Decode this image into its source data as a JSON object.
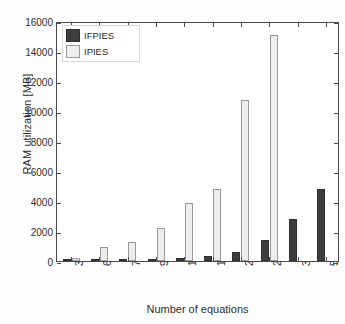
{
  "chart_data": {
    "type": "bar",
    "title": "",
    "xlabel": "Number of equations",
    "ylabel": "RAM utilization [MB]",
    "categories": [
      "3212",
      "6424",
      "7212",
      "9636",
      "12812",
      "14424",
      "21636",
      "25624",
      "38436",
      "51248"
    ],
    "series": [
      {
        "name": "IFPIES",
        "color": "#3d3d3d",
        "values": [
          40,
          90,
          130,
          110,
          170,
          360,
          600,
          1420,
          2800,
          4780
        ]
      },
      {
        "name": "IPIES",
        "color": "#ededed",
        "values": [
          210,
          960,
          1240,
          2180,
          3850,
          4820,
          10750,
          15100,
          null,
          null
        ]
      }
    ],
    "ylim": [
      0,
      16000
    ],
    "yticks": [
      0,
      2000,
      4000,
      6000,
      8000,
      10000,
      12000,
      14000,
      16000
    ],
    "ytick_labels": [
      "0",
      "2000",
      "4000",
      "6000",
      "8000",
      "10000",
      "12000",
      "14000",
      "16000"
    ],
    "grid": false,
    "legend_position": "upper-left"
  },
  "legend": {
    "entries": [
      {
        "label": "IFPIES"
      },
      {
        "label": "IPIES"
      }
    ]
  },
  "axes": {
    "x_title": "Number of equations",
    "y_title": "RAM utilization [MB]"
  }
}
